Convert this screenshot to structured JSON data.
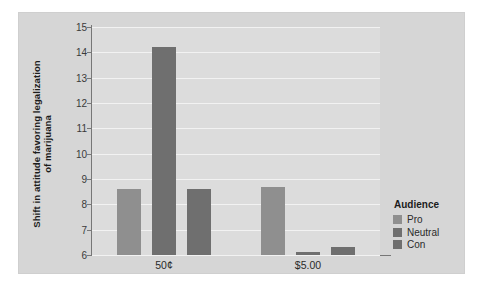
{
  "chart_data": {
    "type": "bar",
    "title": "",
    "subtitle": "",
    "xlabel": "",
    "ylabel": "Shift in attitude favoring legalization of marijuana",
    "ylabel_lines": [
      "Shift in attitude favoring legalization",
      "of marijuana"
    ],
    "categories": [
      "50¢",
      "$5.00"
    ],
    "series": [
      {
        "name": "Pro",
        "values": [
          8.6,
          8.7
        ],
        "color": "#8f8f8f"
      },
      {
        "name": "Neutral",
        "values": [
          14.2,
          6.1
        ],
        "color": "#6f6f6f"
      },
      {
        "name": "Con",
        "values": [
          8.6,
          6.3
        ],
        "color": "#6f6f6f"
      }
    ],
    "ylim": [
      6,
      15
    ],
    "yticks": [
      6,
      7,
      8,
      9,
      10,
      11,
      12,
      13,
      14,
      15
    ],
    "ytick_labels": [
      "6",
      "7",
      "8",
      "9",
      "10",
      "11",
      "12",
      "13",
      "14",
      "15"
    ],
    "grid": true,
    "grid_axis": "y",
    "grid_color": "#f2f2f2",
    "legend": {
      "title": "Audience",
      "position": "right",
      "entries": [
        {
          "label": "Pro",
          "color": "#8f8f8f"
        },
        {
          "label": "Neutral",
          "color": "#6f6f6f"
        },
        {
          "label": "Con",
          "color": "#6f6f6f"
        }
      ]
    },
    "plot_background": "#dcdcdc",
    "figure_background": "#d6d6d6",
    "axis_color": "#777777"
  }
}
